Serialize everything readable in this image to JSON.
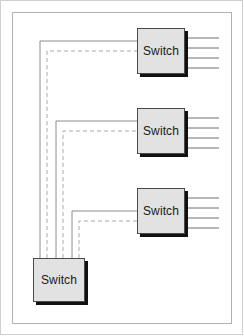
{
  "diagram": {
    "canvas": {
      "width": 244,
      "height": 336
    },
    "colors": {
      "background": "#ffffff",
      "outer_border": "#cfcfcf",
      "inner_border": "#b3b3b3",
      "box_fill": "#e2e2e2",
      "box_border": "#4a4a4a",
      "box_shadow": "#111111",
      "wire_solid": "#8c8c8c",
      "wire_dashed": "#a8a8a8",
      "port_line": "#6f6f6f",
      "label_text": "#1a1a1a"
    },
    "nodes": [
      {
        "id": "switch-top",
        "label": "Switch",
        "x": 137,
        "y": 28,
        "w": 48,
        "h": 46,
        "ports": 4
      },
      {
        "id": "switch-middle",
        "label": "Switch",
        "x": 137,
        "y": 108,
        "w": 48,
        "h": 46,
        "ports": 4
      },
      {
        "id": "switch-lower",
        "label": "Switch",
        "x": 137,
        "y": 188,
        "w": 48,
        "h": 46,
        "ports": 4
      },
      {
        "id": "switch-bottom",
        "label": "Switch",
        "x": 33,
        "y": 258,
        "w": 52,
        "h": 44,
        "ports": 0
      }
    ],
    "links": [
      {
        "id": "link-bottom-to-top-solid",
        "from": "switch-bottom",
        "to": "switch-top",
        "style": "solid",
        "path": "M 40 258 L 40 41 L 137 41"
      },
      {
        "id": "link-bottom-to-top-dashed",
        "from": "switch-bottom",
        "to": "switch-top",
        "style": "dashed",
        "path": "M 47 258 L 47 51 L 137 51"
      },
      {
        "id": "link-bottom-to-middle-solid",
        "from": "switch-bottom",
        "to": "switch-middle",
        "style": "solid",
        "path": "M 56 258 L 56 121 L 137 121"
      },
      {
        "id": "link-bottom-to-middle-dashed",
        "from": "switch-bottom",
        "to": "switch-middle",
        "style": "dashed",
        "path": "M 63 258 L 63 131 L 137 131"
      },
      {
        "id": "link-bottom-to-lower-solid",
        "from": "switch-bottom",
        "to": "switch-lower",
        "style": "solid",
        "path": "M 72 258 L 72 211 L 137 211"
      },
      {
        "id": "link-bottom-to-lower-dashed",
        "from": "switch-bottom",
        "to": "switch-lower",
        "style": "dashed",
        "path": "M 79 258 L 79 221 L 137 221"
      }
    ],
    "port_groups": [
      {
        "id": "ports-switch-top",
        "node": "switch-top",
        "x1": 185,
        "x2": 219,
        "ys": [
          38,
          48,
          58,
          68
        ]
      },
      {
        "id": "ports-switch-middle",
        "node": "switch-middle",
        "x1": 185,
        "x2": 219,
        "ys": [
          118,
          128,
          138,
          148
        ]
      },
      {
        "id": "ports-switch-lower",
        "node": "switch-lower",
        "x1": 185,
        "x2": 219,
        "ys": [
          198,
          208,
          218,
          228
        ]
      }
    ]
  }
}
